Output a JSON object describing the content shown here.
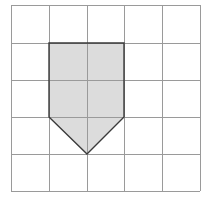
{
  "diagram": {
    "type": "grid-polygon",
    "grid": {
      "columns": 5,
      "rows": 5,
      "x_lines": [
        11,
        49,
        87,
        124,
        162,
        200
      ],
      "y_lines": [
        5,
        43,
        80,
        117,
        154,
        191
      ],
      "line_color": "#9a9a9a"
    },
    "shape": {
      "name": "pentagon-arrow",
      "points_grid_units": [
        [
          1,
          1
        ],
        [
          3,
          1
        ],
        [
          3,
          3
        ],
        [
          2,
          4
        ],
        [
          1,
          3
        ]
      ],
      "points_px": "49,43 124,43 124,117 87,154 49,117",
      "fill": "#dcdcdc",
      "stroke": "#3a3a3a"
    }
  }
}
